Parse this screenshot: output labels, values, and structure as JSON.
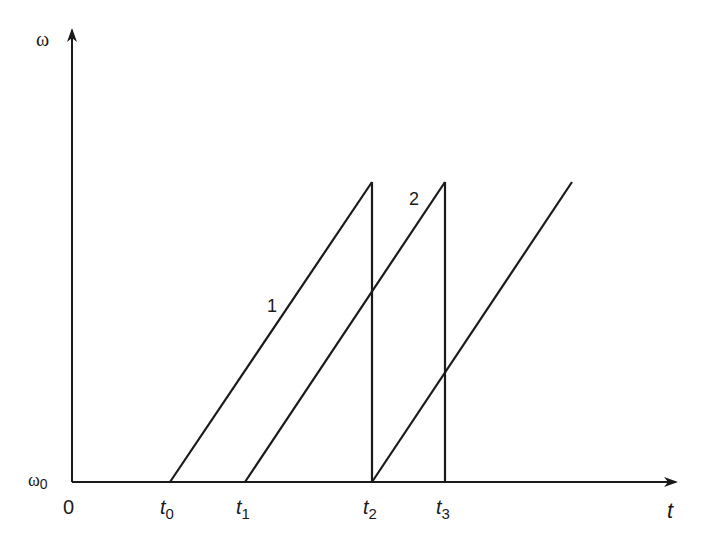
{
  "diagram": {
    "type": "sawtooth-timing",
    "y_axis": {
      "label": "ω",
      "origin_label": "ω₀",
      "origin_sub": "0",
      "origin_base": "ω"
    },
    "x_axis": {
      "label": "t",
      "origin": "0"
    },
    "ticks": [
      {
        "base": "t",
        "sub": "0"
      },
      {
        "base": "t",
        "sub": "1"
      },
      {
        "base": "t",
        "sub": "2"
      },
      {
        "base": "t",
        "sub": "3"
      }
    ],
    "curves": [
      {
        "label": "1"
      },
      {
        "label": "2"
      }
    ],
    "colors": {
      "line": "#1a1a1a",
      "background": "#ffffff"
    }
  }
}
